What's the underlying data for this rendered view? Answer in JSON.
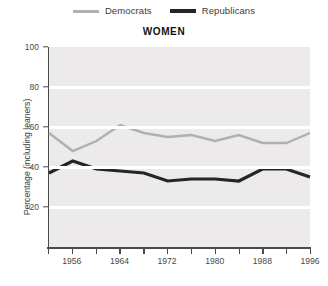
{
  "chart_data": {
    "type": "line",
    "title": "WOMEN",
    "xlabel": "",
    "ylabel": "Percentage (including leaners)",
    "ylim": [
      0,
      100
    ],
    "xlim": [
      1952,
      1996
    ],
    "yticks": [
      20,
      40,
      60,
      80,
      100
    ],
    "xticks": [
      1952,
      1956,
      1960,
      1964,
      1968,
      1972,
      1976,
      1980,
      1984,
      1988,
      1992,
      1996
    ],
    "xtick_labels": [
      "",
      "1956",
      "",
      "1964",
      "",
      "1972",
      "",
      "1980",
      "",
      "1988",
      "",
      "1996"
    ],
    "grid": "horizontal",
    "legend_position": "top-center",
    "x": [
      1952,
      1956,
      1960,
      1964,
      1968,
      1972,
      1976,
      1980,
      1984,
      1988,
      1992,
      1996
    ],
    "series": [
      {
        "name": "Democrats",
        "color": "#b0b0b0",
        "values": [
          57,
          48,
          53,
          61,
          57,
          55,
          56,
          53,
          56,
          52,
          52,
          57
        ]
      },
      {
        "name": "Republicans",
        "color": "#252525",
        "values": [
          37,
          43,
          39,
          38,
          37,
          33,
          34,
          34,
          33,
          39,
          39,
          35
        ]
      }
    ]
  },
  "legend": {
    "items": [
      {
        "label": "Democrats",
        "color": "#b0b0b0"
      },
      {
        "label": "Republicans",
        "color": "#252525"
      }
    ]
  },
  "axes": {
    "y_title": "Percentage (including leaners)",
    "y_labels": [
      "100",
      "80",
      "60",
      "40",
      "20"
    ],
    "x_labels": [
      "1956",
      "1964",
      "1972",
      "1980",
      "1988",
      "1996"
    ]
  },
  "title": "WOMEN",
  "colors": {
    "plot_background": "#eceaea",
    "gridline": "#ffffff",
    "axis": "#4a4a4a",
    "democrat": "#b0b0b0",
    "republican": "#252525"
  }
}
